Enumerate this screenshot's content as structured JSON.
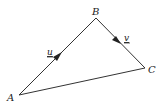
{
  "diagram": {
    "type": "vector-triangle",
    "vertices": [
      {
        "label": "A",
        "x": 19,
        "y": 95
      },
      {
        "label": "B",
        "x": 96,
        "y": 18
      },
      {
        "label": "C",
        "x": 145,
        "y": 68
      }
    ],
    "edges": [
      {
        "from": "A",
        "to": "B",
        "vector": "u",
        "arrow": true
      },
      {
        "from": "B",
        "to": "C",
        "vector": "v",
        "arrow": true
      },
      {
        "from": "A",
        "to": "C",
        "vector": "",
        "arrow": false
      }
    ],
    "labels": {
      "A": "A",
      "B": "B",
      "C": "C",
      "u": "u",
      "v": "v"
    },
    "colors": {
      "stroke": "#333333",
      "text": "#222222",
      "background": "#ffffff"
    }
  }
}
